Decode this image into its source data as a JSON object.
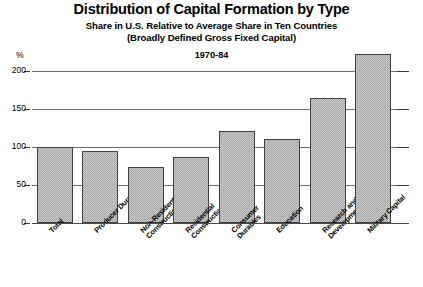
{
  "chart_data": {
    "type": "bar",
    "title": "Distribution of Capital Formation by Type",
    "subtitle1": "Share in U.S. Relative to Average Share in Ten Countries",
    "subtitle2": "(Broadly Defined Gross Fixed Capital)",
    "period": "1970-84",
    "unit_label": "%",
    "xlabel": "",
    "ylabel": "%",
    "ylim": [
      0,
      225
    ],
    "ytick_values": [
      0,
      50,
      100,
      150,
      200
    ],
    "ytick_labels": [
      "0",
      "50",
      "100",
      "150",
      "200"
    ],
    "grid": true,
    "grid_axis": "y",
    "legend": "none",
    "categories": [
      "Total",
      "Producer Durables",
      "Non-Residential Construction",
      "Residential Construction",
      "Consumer Durables",
      "Education",
      "Research and Development",
      "Military Capital"
    ],
    "category_lines": [
      [
        "Total"
      ],
      [
        "Producer Durables"
      ],
      [
        "Non-Residential",
        "Construction"
      ],
      [
        "Residential",
        "Construction"
      ],
      [
        "Consumer",
        "Durables"
      ],
      [
        "Education"
      ],
      [
        "Research and",
        "Development"
      ],
      [
        "Military Capital"
      ]
    ],
    "values": [
      100,
      95,
      74,
      87,
      121,
      111,
      165,
      223
    ],
    "bar_color": "#c9c9c9",
    "bar_border_color": "#404040",
    "grid_color": "#6d6d6d",
    "axis_color": "#4a4a4a",
    "text_color": "#000000"
  }
}
